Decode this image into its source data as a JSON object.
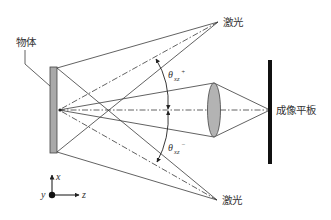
{
  "diagram": {
    "type": "optical-schematic",
    "labels": {
      "object": "物体",
      "laser_top": "激光",
      "laser_bottom": "激光",
      "imaging_plate": "成像平板",
      "angle_top_main": "θ",
      "angle_top_sub": "xz",
      "angle_top_sup": "+",
      "angle_bottom_main": "θ",
      "angle_bottom_sub": "xz",
      "angle_bottom_sup": "−",
      "axis_x": "x",
      "axis_y": "y",
      "axis_z": "z"
    },
    "colors": {
      "line": "#3a3a3a",
      "object_fill": "#a9a9a9",
      "lens_fill": "#b3b3b3",
      "plate": "#111111"
    },
    "elements": [
      {
        "name": "object",
        "kind": "rectangle"
      },
      {
        "name": "laser-top",
        "kind": "point-source"
      },
      {
        "name": "laser-bottom",
        "kind": "point-source"
      },
      {
        "name": "lens",
        "kind": "ellipse"
      },
      {
        "name": "imaging-plate",
        "kind": "bar"
      },
      {
        "name": "optical-axis",
        "kind": "dash-dot-line"
      },
      {
        "name": "angle-arc",
        "kind": "double-arc-arrow"
      },
      {
        "name": "coordinate-axes",
        "kind": "axes"
      }
    ]
  }
}
